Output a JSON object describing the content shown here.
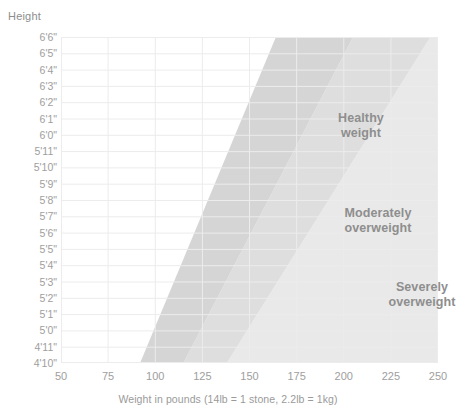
{
  "chart_data": {
    "type": "area",
    "title": "",
    "xlabel": "Weight in pounds (14lb = 1 stone,  2.2lb = 1kg)",
    "ylabel": "Height",
    "xlim": [
      50,
      250
    ],
    "ylim": [
      "4'10\"",
      "6'6\""
    ],
    "xticks": [
      50,
      75,
      100,
      125,
      150,
      175,
      200,
      225,
      250
    ],
    "yticks": [
      "6'6\"",
      "6'5\"",
      "6'4\"",
      "6'3\"",
      "6'2\"",
      "6'1\"",
      "6'0\"",
      "5'11\"",
      "5'10\"",
      "5'9\"",
      "5'8\"",
      "5'7\"",
      "5'6\"",
      "5'5\"",
      "5'4\"",
      "5'3\"",
      "5'2\"",
      "5'1\"",
      "5'0\"",
      "4'11\"",
      "4'10\""
    ],
    "grid": true,
    "legend_position": "in-plot-annotations",
    "bands": [
      {
        "name": "Healthy weight",
        "label": "Healthy\nweight",
        "color": "#d5d5d5",
        "boundary_low_lb": {
          "at_4ft10": 92,
          "at_6ft6": 164
        },
        "boundary_high_lb": {
          "at_4ft10": 115,
          "at_6ft6": 205
        }
      },
      {
        "name": "Moderately overweight",
        "label": "Moderately\noverweight",
        "color": "#dedede",
        "boundary_low_lb": {
          "at_4ft10": 115,
          "at_6ft6": 205
        },
        "boundary_high_lb": {
          "at_4ft10": 138,
          "at_6ft6": 246
        }
      },
      {
        "name": "Severely overweight",
        "label": "Severely\noverweight",
        "color": "#e9e9e9",
        "boundary_low_lb": {
          "at_4ft10": 138,
          "at_6ft6": 246
        },
        "boundary_high_lb": {
          "at_4ft10": 250,
          "at_6ft6": 250
        }
      }
    ],
    "colors": {
      "healthy": "#d5d5d5",
      "moderate": "#dedede",
      "severe": "#e9e9e9",
      "grid": "#ececec",
      "text": "#9a9a9a",
      "band_text": "#8e8e8e",
      "background": "#ffffff"
    }
  },
  "axes": {
    "y_title": "Height",
    "x_caption": "Weight in pounds (14lb = 1 stone,  2.2lb = 1kg)"
  },
  "bands": {
    "healthy": "Healthy\nweight",
    "moderate": "Moderately\noverweight",
    "severe": "Severely\noverweight"
  }
}
